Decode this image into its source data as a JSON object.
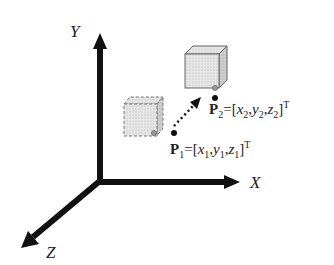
{
  "diagram": {
    "type": "3d-coordinate-translation",
    "axes": {
      "x_label": "X",
      "y_label": "Y",
      "z_label": "Z"
    },
    "points": [
      {
        "name": "P1",
        "symbol": "P",
        "index": "1",
        "equals": "=[",
        "coords": [
          "x",
          "1",
          "y",
          "1",
          "z",
          "1"
        ],
        "transpose": "T",
        "text": "P1=[x1,y1,z1]T"
      },
      {
        "name": "P2",
        "symbol": "P",
        "index": "2",
        "equals": "=[",
        "coords": [
          "x",
          "2",
          "y",
          "2",
          "z",
          "2"
        ],
        "transpose": "T",
        "text": "P2=[x2,y2,z2]T"
      }
    ],
    "objects": [
      {
        "name": "original-cube",
        "style": "dashed",
        "fill": "#d8d8d8"
      },
      {
        "name": "translated-cube",
        "style": "solid",
        "fill": "#e0e0e0"
      }
    ],
    "arrow": {
      "style": "dotted",
      "from": "P1",
      "to": "P2"
    }
  }
}
